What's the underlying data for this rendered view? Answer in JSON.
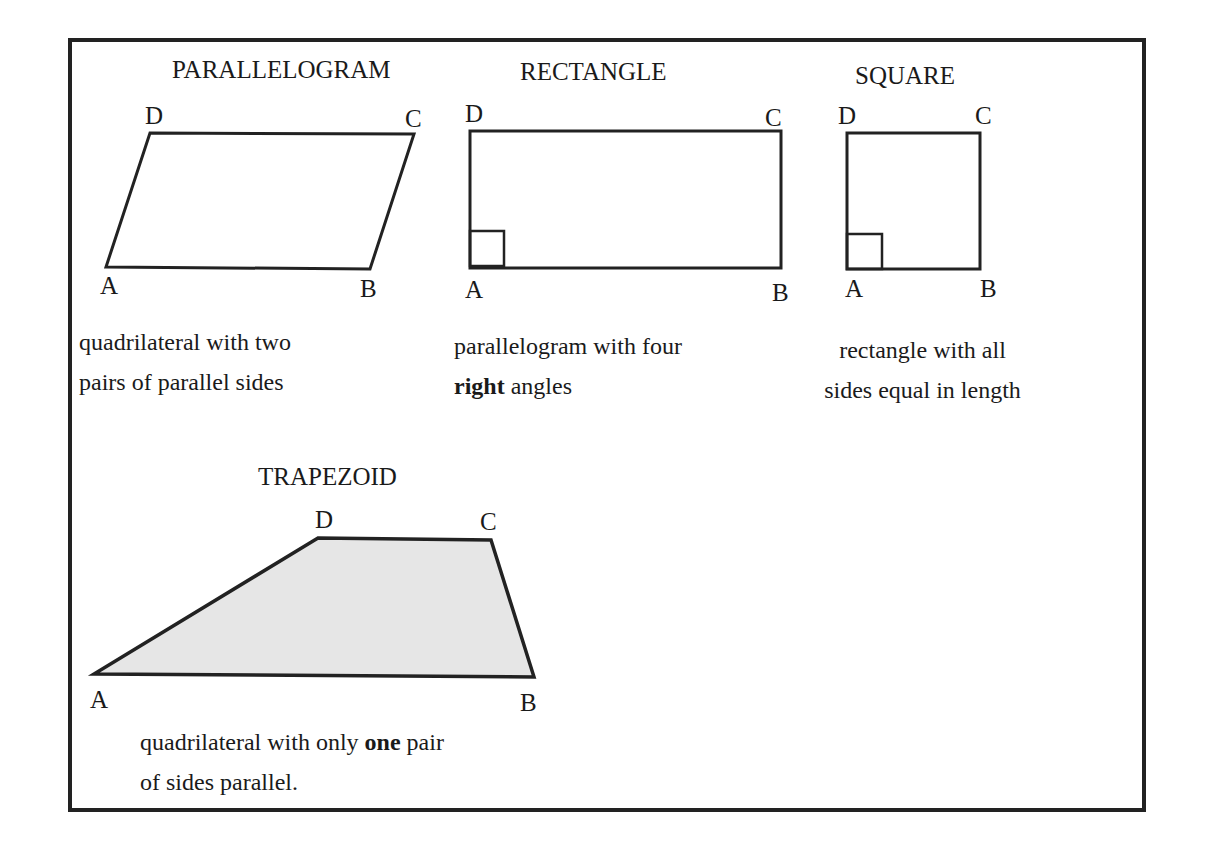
{
  "shapes": [
    {
      "title": "PARALLELOGRAM",
      "vertices": [
        "A",
        "B",
        "C",
        "D"
      ],
      "desc_line1": "quadrilateral with two",
      "desc_line2": "pairs of parallel sides"
    },
    {
      "title": "RECTANGLE",
      "vertices": [
        "A",
        "B",
        "C",
        "D"
      ],
      "desc_line1": "parallelogram with four",
      "desc_line2_bold": "right",
      "desc_line2_rest": " angles"
    },
    {
      "title": "SQUARE",
      "vertices": [
        "A",
        "B",
        "C",
        "D"
      ],
      "desc_line1": "rectangle with all",
      "desc_line2": "sides equal in length"
    },
    {
      "title": "TRAPEZOID",
      "vertices": [
        "A",
        "B",
        "C",
        "D"
      ],
      "desc_line1_pre": "quadrilateral with only ",
      "desc_line1_bold": "one",
      "desc_line1_post": " pair",
      "desc_line2": "of sides parallel."
    }
  ],
  "colors": {
    "stroke": "#222222",
    "trapezoid_fill": "#e6e6e6"
  }
}
